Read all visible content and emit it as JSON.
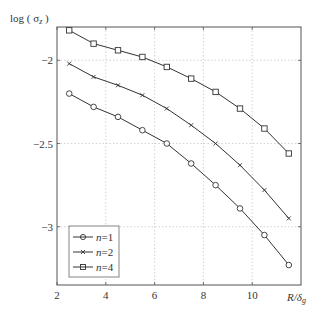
{
  "chart_data": {
    "type": "line",
    "title": "",
    "xlabel": "R/δ_g",
    "ylabel": "log ( σ_z )",
    "xlim": [
      2,
      12
    ],
    "ylim": [
      -3.35,
      -1.8
    ],
    "xticks": [
      2,
      4,
      6,
      8,
      10
    ],
    "xtick_labels": [
      "2",
      "4",
      "6",
      "8",
      "10"
    ],
    "yticks": [
      -2,
      -2.5,
      -3
    ],
    "ytick_labels": [
      "-2",
      "-2.5",
      "-3"
    ],
    "grid": true,
    "legend_position": "lower left",
    "x": [
      2.5,
      3.5,
      4.5,
      5.5,
      6.5,
      7.5,
      8.5,
      9.5,
      10.5,
      11.5
    ],
    "series": [
      {
        "name": "n=1",
        "marker": "circle",
        "values": [
          -2.2,
          -2.28,
          -2.34,
          -2.42,
          -2.5,
          -2.62,
          -2.75,
          -2.89,
          -3.05,
          -3.23
        ]
      },
      {
        "name": "n=2",
        "marker": "x",
        "values": [
          -2.02,
          -2.1,
          -2.15,
          -2.21,
          -2.29,
          -2.39,
          -2.5,
          -2.63,
          -2.78,
          -2.95
        ]
      },
      {
        "name": "n=4",
        "marker": "square",
        "values": [
          -1.82,
          -1.9,
          -1.94,
          -1.98,
          -2.04,
          -2.11,
          -2.19,
          -2.29,
          -2.41,
          -2.56
        ]
      }
    ],
    "colors": {
      "line": "#333333",
      "grid": "#c8c8c8",
      "axis": "#555555"
    }
  },
  "labels": {
    "ylabel_main": "log ( σ",
    "ylabel_sub": "z",
    "ylabel_close": " )",
    "xlabel_main": "R/δ",
    "xlabel_sub": "g",
    "legend": [
      {
        "prefix": "n",
        "suffix": "=1"
      },
      {
        "prefix": "n",
        "suffix": "=2"
      },
      {
        "prefix": "n",
        "suffix": "=4"
      }
    ]
  }
}
